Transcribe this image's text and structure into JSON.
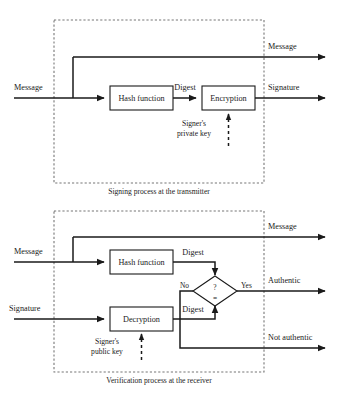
{
  "figure": {
    "bottom_caption": ""
  },
  "top": {
    "region_caption": "Signing process at the transmitter",
    "inputs": [
      {
        "label": "Message"
      }
    ],
    "outputs": [
      {
        "label": "Message"
      },
      {
        "label": "Signature"
      }
    ],
    "boxes": [
      {
        "label": "Hash function"
      },
      {
        "label": "Encryption"
      }
    ],
    "edge_labels": [
      {
        "label": "Digest"
      }
    ],
    "key": {
      "line1": "Signer's",
      "line2": "private key"
    }
  },
  "bottom": {
    "region_caption": "Verification process at the receiver",
    "inputs": [
      {
        "label": "Message"
      },
      {
        "label": "Signature"
      }
    ],
    "outputs": [
      {
        "label": "Message"
      },
      {
        "label": "Authentic"
      },
      {
        "label": "Not authentic"
      }
    ],
    "boxes": [
      {
        "label": "Hash function"
      },
      {
        "label": "Decryption"
      }
    ],
    "edge_labels": [
      {
        "label": "Digest"
      },
      {
        "label": "Digest"
      }
    ],
    "decision": {
      "question_mark": "?",
      "equals": "=",
      "branch_no": "No",
      "branch_yes": "Yes"
    },
    "key": {
      "line1": "Signer's",
      "line2": "public key"
    }
  },
  "colors": {
    "stroke": "#1a1a1a",
    "dashed_region": "#777777",
    "background": "#ffffff"
  }
}
